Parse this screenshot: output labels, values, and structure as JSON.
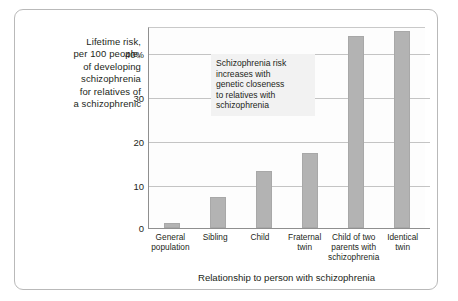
{
  "chart_data": {
    "type": "bar",
    "title": "",
    "ylabel": "Lifetime risk, per 100 people, of developing schizophrenia for relatives of a schizophrenic",
    "ylabel_lines": [
      "Lifetime risk,",
      "per 100 people,",
      "of developing",
      "schizophrenia",
      "for relatives of",
      "a schizophrenic"
    ],
    "xlabel": "Relationship to person with schizophrenia",
    "categories": [
      "General population",
      "Sibling",
      "Child",
      "Fraternal twin",
      "Child of two parents with schizophrenia",
      "Identical twin"
    ],
    "category_lines": [
      [
        "General",
        "population"
      ],
      [
        "Sibling"
      ],
      [
        "Child"
      ],
      [
        "Fraternal",
        "twin"
      ],
      [
        "Child of two",
        "parents with",
        "schizophrenia"
      ],
      [
        "Identical",
        "twin"
      ]
    ],
    "values": [
      1,
      7,
      13,
      17,
      44,
      45
    ],
    "ylim": [
      0,
      46
    ],
    "yticks": [
      0,
      10,
      20,
      30,
      40
    ],
    "ytick_labels": [
      "0",
      "10",
      "20",
      "30",
      "40%"
    ],
    "grid": true,
    "legend": "none",
    "bar_color": "#b3b3b3",
    "annotation_lines": [
      "Schizophrenia risk",
      "increases with",
      "genetic closeness",
      "to relatives with",
      "schizophrenia"
    ]
  }
}
